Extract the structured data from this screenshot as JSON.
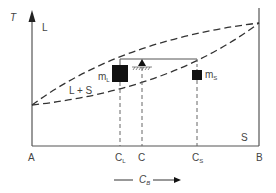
{
  "diagram": {
    "type": "binary phase diagram with lever rule",
    "axis_y_label": "T",
    "axis_x_label_main": "C",
    "axis_x_label_sub": "B",
    "regions": {
      "liquid": "L",
      "two_phase": "L + S",
      "solid": "S"
    },
    "x_ticks": [
      {
        "id": "A",
        "main": "A",
        "sub": ""
      },
      {
        "id": "CL",
        "main": "C",
        "sub": "L"
      },
      {
        "id": "C",
        "main": "C",
        "sub": ""
      },
      {
        "id": "CS",
        "main": "C",
        "sub": "S"
      },
      {
        "id": "B",
        "main": "B",
        "sub": ""
      }
    ],
    "masses": {
      "liquid": {
        "main": "m",
        "sub": "L"
      },
      "solid": {
        "main": "m",
        "sub": "S"
      }
    },
    "colors": {
      "lines": "#555555",
      "masses": "#111111",
      "text": "#444444"
    }
  }
}
